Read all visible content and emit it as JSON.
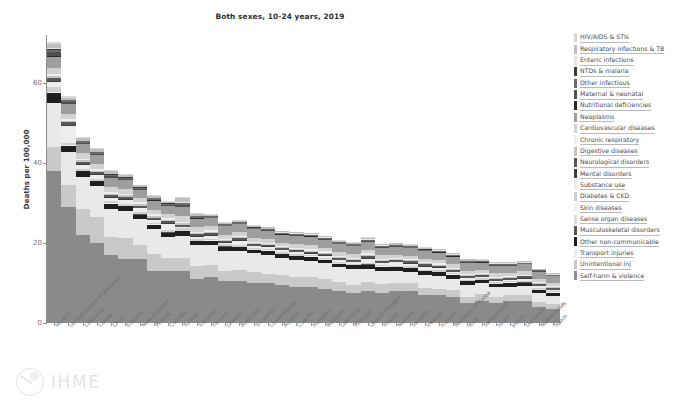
{
  "chart_data": {
    "type": "bar",
    "stacked": true,
    "title": "Both sexes, 10-24 years, 2019",
    "xlabel": "",
    "ylabel": "Deaths per 100,000",
    "ylim": [
      0,
      72
    ],
    "yticks": [
      0,
      20,
      40,
      60
    ],
    "grid": false,
    "legend_position": "right",
    "categories": [
      "Mexico",
      "United States of America",
      "Lithuania",
      "Latvia",
      "Chile",
      "Estonia",
      "New Zealand",
      "Poland",
      "Canada",
      "Turkey",
      "Slovakia",
      "Finland",
      "Greece",
      "Australia",
      "Slovenia",
      "Luxembourg",
      "Austria",
      "Czechia",
      "Hungary",
      "Belgium",
      "Germany",
      "Portugal",
      "United Kingdom",
      "France",
      "Norway",
      "Sweden",
      "Ireland",
      "Iceland",
      "Republic of Korea",
      "Italy",
      "Switzerland",
      "Israel",
      "Japan",
      "Denmark",
      "Netherlands",
      "Spain"
    ],
    "series": [
      {
        "name": "HIV/AIDS & STIs",
        "color": "#d9d9d9",
        "values": [
          0.6,
          0.4,
          0.2,
          0.3,
          0.3,
          0.3,
          0.2,
          0.2,
          0.2,
          0.2,
          0.2,
          0.2,
          0.2,
          0.2,
          0.1,
          0.1,
          0.1,
          0.1,
          0.1,
          0.1,
          0.1,
          0.1,
          0.1,
          0.1,
          0.1,
          0.1,
          0.1,
          0.1,
          0.1,
          0.1,
          0.1,
          0.1,
          0.1,
          0.1,
          0.1,
          0.1
        ]
      },
      {
        "name": "Respiratory infections & TB",
        "color": "#bfbfbf",
        "values": [
          0.9,
          0.5,
          0.6,
          0.6,
          0.6,
          0.5,
          0.4,
          0.4,
          0.3,
          0.9,
          0.4,
          0.3,
          0.3,
          0.3,
          0.3,
          0.3,
          0.3,
          0.3,
          0.3,
          0.3,
          0.3,
          0.3,
          0.4,
          0.3,
          0.3,
          0.3,
          0.3,
          0.3,
          0.3,
          0.3,
          0.2,
          0.3,
          0.3,
          0.2,
          0.2,
          0.2
        ]
      },
      {
        "name": "Enteric infections",
        "color": "#e6e6e6",
        "values": [
          0.3,
          0.1,
          0.1,
          0.1,
          0.2,
          0.1,
          0.1,
          0.1,
          0.1,
          0.2,
          0.1,
          0.1,
          0.1,
          0.1,
          0.1,
          0.1,
          0.1,
          0.1,
          0.1,
          0.1,
          0.1,
          0.1,
          0.1,
          0.1,
          0.1,
          0.1,
          0.1,
          0.1,
          0.1,
          0.1,
          0.1,
          0.1,
          0.1,
          0.1,
          0.1,
          0.1
        ]
      },
      {
        "name": "NTDs & malaria",
        "color": "#3a3a3a",
        "values": [
          0.2,
          0.1,
          0.05,
          0.05,
          0.1,
          0.05,
          0.05,
          0.05,
          0.05,
          0.1,
          0.05,
          0.05,
          0.05,
          0.05,
          0.05,
          0.05,
          0.05,
          0.05,
          0.05,
          0.05,
          0.05,
          0.05,
          0.05,
          0.05,
          0.05,
          0.05,
          0.05,
          0.05,
          0.05,
          0.05,
          0.05,
          0.05,
          0.05,
          0.05,
          0.05,
          0.05
        ]
      },
      {
        "name": "Other infectious",
        "color": "#6b6b6b",
        "values": [
          0.7,
          0.4,
          0.4,
          0.4,
          0.4,
          0.3,
          0.3,
          0.3,
          0.3,
          0.5,
          0.3,
          0.3,
          0.3,
          0.3,
          0.3,
          0.3,
          0.3,
          0.3,
          0.3,
          0.3,
          0.3,
          0.3,
          0.3,
          0.3,
          0.3,
          0.3,
          0.3,
          0.3,
          0.3,
          0.3,
          0.2,
          0.3,
          0.3,
          0.2,
          0.2,
          0.2
        ]
      },
      {
        "name": "Maternal & neonatal",
        "color": "#4f4f4f",
        "values": [
          1.0,
          0.4,
          0.2,
          0.2,
          0.4,
          0.2,
          0.2,
          0.2,
          0.2,
          0.5,
          0.2,
          0.1,
          0.1,
          0.1,
          0.1,
          0.1,
          0.1,
          0.1,
          0.1,
          0.1,
          0.1,
          0.1,
          0.1,
          0.1,
          0.1,
          0.1,
          0.1,
          0.1,
          0.1,
          0.1,
          0.1,
          0.1,
          0.1,
          0.1,
          0.1,
          0.1
        ]
      },
      {
        "name": "Nutritional deficiencies",
        "color": "#2b2b2b",
        "values": [
          0.2,
          0.1,
          0.05,
          0.05,
          0.1,
          0.05,
          0.05,
          0.05,
          0.05,
          0.1,
          0.05,
          0.05,
          0.05,
          0.05,
          0.05,
          0.05,
          0.05,
          0.05,
          0.05,
          0.05,
          0.05,
          0.05,
          0.05,
          0.05,
          0.05,
          0.05,
          0.05,
          0.05,
          0.05,
          0.05,
          0.05,
          0.05,
          0.05,
          0.05,
          0.05,
          0.05
        ]
      },
      {
        "name": "Neoplasms",
        "color": "#9e9e9e",
        "values": [
          2.6,
          2.4,
          2.4,
          2.3,
          2.3,
          2.3,
          2.2,
          2.3,
          2.2,
          2.2,
          2.2,
          2.1,
          2.1,
          2.0,
          2.1,
          2.0,
          2.0,
          2.1,
          2.1,
          2.0,
          2.0,
          2.0,
          2.0,
          1.9,
          1.9,
          1.9,
          1.9,
          1.9,
          1.9,
          1.9,
          1.8,
          1.9,
          1.8,
          1.8,
          1.8,
          1.8
        ]
      },
      {
        "name": "Cardiovascular diseases",
        "color": "#d2d2d2",
        "values": [
          1.6,
          1.3,
          1.4,
          1.3,
          1.2,
          1.2,
          1.0,
          1.2,
          1.0,
          1.4,
          1.1,
          1.0,
          1.0,
          0.9,
          1.0,
          0.9,
          0.9,
          1.0,
          1.1,
          0.9,
          0.9,
          0.9,
          0.9,
          0.9,
          0.8,
          0.8,
          0.8,
          0.8,
          0.9,
          0.8,
          0.8,
          0.8,
          0.8,
          0.8,
          0.8,
          0.7
        ]
      },
      {
        "name": "Chronic respiratory",
        "color": "#efefef",
        "values": [
          0.5,
          0.5,
          0.4,
          0.4,
          0.4,
          0.4,
          0.5,
          0.4,
          0.4,
          0.4,
          0.3,
          0.3,
          0.3,
          0.4,
          0.3,
          0.3,
          0.3,
          0.3,
          0.3,
          0.3,
          0.3,
          0.3,
          0.4,
          0.3,
          0.3,
          0.3,
          0.3,
          0.3,
          0.3,
          0.3,
          0.3,
          0.3,
          0.3,
          0.3,
          0.3,
          0.3
        ]
      },
      {
        "name": "Digestive diseases",
        "color": "#c4c4c4",
        "values": [
          0.6,
          0.4,
          0.4,
          0.4,
          0.4,
          0.4,
          0.3,
          0.4,
          0.3,
          0.4,
          0.3,
          0.3,
          0.3,
          0.3,
          0.3,
          0.3,
          0.3,
          0.3,
          0.3,
          0.3,
          0.3,
          0.3,
          0.3,
          0.3,
          0.3,
          0.3,
          0.3,
          0.3,
          0.3,
          0.3,
          0.2,
          0.3,
          0.3,
          0.2,
          0.2,
          0.2
        ]
      },
      {
        "name": "Neurological disorders",
        "color": "#585858",
        "values": [
          0.7,
          0.6,
          0.5,
          0.5,
          0.5,
          0.5,
          0.5,
          0.5,
          0.5,
          0.5,
          0.5,
          0.5,
          0.4,
          0.5,
          0.4,
          0.4,
          0.4,
          0.4,
          0.4,
          0.4,
          0.4,
          0.4,
          0.5,
          0.4,
          0.4,
          0.4,
          0.4,
          0.4,
          0.4,
          0.4,
          0.4,
          0.4,
          0.4,
          0.4,
          0.4,
          0.4
        ]
      },
      {
        "name": "Mental disorders",
        "color": "#3f3f3f",
        "values": [
          0.2,
          0.3,
          0.2,
          0.2,
          0.2,
          0.2,
          0.2,
          0.2,
          0.2,
          0.1,
          0.2,
          0.2,
          0.1,
          0.2,
          0.1,
          0.1,
          0.1,
          0.1,
          0.1,
          0.1,
          0.1,
          0.1,
          0.2,
          0.1,
          0.2,
          0.2,
          0.2,
          0.2,
          0.1,
          0.1,
          0.1,
          0.1,
          0.1,
          0.2,
          0.2,
          0.1
        ]
      },
      {
        "name": "Substance use",
        "color": "#ededed",
        "values": [
          1.2,
          4.2,
          1.0,
          0.9,
          0.7,
          1.0,
          0.9,
          0.6,
          1.6,
          0.3,
          0.6,
          0.9,
          0.4,
          1.0,
          0.5,
          0.6,
          0.5,
          0.5,
          0.4,
          0.6,
          0.5,
          0.4,
          1.0,
          0.5,
          0.8,
          0.7,
          0.7,
          0.6,
          0.2,
          0.4,
          0.4,
          0.3,
          0.2,
          0.5,
          0.4,
          0.3
        ]
      },
      {
        "name": "Diabetes & CKD",
        "color": "#cfcfcf",
        "values": [
          1.4,
          0.7,
          0.5,
          0.5,
          0.6,
          0.5,
          0.5,
          0.4,
          0.4,
          0.6,
          0.4,
          0.3,
          0.4,
          0.4,
          0.3,
          0.3,
          0.3,
          0.3,
          0.3,
          0.3,
          0.3,
          0.3,
          0.3,
          0.3,
          0.3,
          0.3,
          0.3,
          0.3,
          0.4,
          0.3,
          0.3,
          0.3,
          0.3,
          0.3,
          0.3,
          0.3
        ]
      },
      {
        "name": "Skin diseases",
        "color": "#f2f2f2",
        "values": [
          0.1,
          0.05,
          0.05,
          0.05,
          0.05,
          0.05,
          0.05,
          0.05,
          0.05,
          0.05,
          0.05,
          0.05,
          0.05,
          0.05,
          0.05,
          0.05,
          0.05,
          0.05,
          0.05,
          0.05,
          0.05,
          0.05,
          0.05,
          0.05,
          0.05,
          0.05,
          0.05,
          0.05,
          0.05,
          0.05,
          0.05,
          0.05,
          0.05,
          0.05,
          0.05,
          0.05
        ]
      },
      {
        "name": "Sense organ diseases",
        "color": "#dcdcdc",
        "values": [
          0.05,
          0.05,
          0.05,
          0.05,
          0.05,
          0.05,
          0.05,
          0.05,
          0.05,
          0.05,
          0.05,
          0.05,
          0.05,
          0.05,
          0.05,
          0.05,
          0.05,
          0.05,
          0.05,
          0.05,
          0.05,
          0.05,
          0.05,
          0.05,
          0.05,
          0.05,
          0.05,
          0.05,
          0.05,
          0.05,
          0.05,
          0.05,
          0.05,
          0.05,
          0.05,
          0.05
        ]
      },
      {
        "name": "Musculoskeletal disorders",
        "color": "#565656",
        "values": [
          0.1,
          0.1,
          0.05,
          0.05,
          0.1,
          0.05,
          0.05,
          0.05,
          0.05,
          0.05,
          0.05,
          0.05,
          0.05,
          0.05,
          0.05,
          0.05,
          0.05,
          0.05,
          0.05,
          0.05,
          0.05,
          0.05,
          0.05,
          0.05,
          0.05,
          0.05,
          0.05,
          0.05,
          0.05,
          0.05,
          0.05,
          0.05,
          0.05,
          0.05,
          0.05,
          0.05
        ]
      },
      {
        "name": "Other non-communicable",
        "color": "#1f1f1f",
        "values": [
          2.4,
          1.4,
          1.3,
          1.2,
          1.3,
          1.2,
          1.1,
          1.1,
          1.0,
          1.1,
          1.0,
          1.0,
          1.0,
          1.0,
          0.9,
          1.0,
          0.9,
          0.9,
          0.9,
          0.9,
          0.9,
          0.9,
          1.0,
          0.9,
          0.9,
          0.9,
          0.9,
          0.9,
          0.9,
          0.8,
          0.8,
          0.8,
          0.9,
          0.8,
          0.8,
          0.8
        ]
      },
      {
        "name": "Transport injuries",
        "color": "#e9e9e9",
        "values": [
          11.0,
          8.4,
          8.0,
          7.8,
          7.0,
          6.8,
          6.6,
          6.2,
          5.4,
          5.6,
          5.2,
          5.0,
          5.2,
          4.6,
          4.6,
          4.8,
          4.2,
          4.2,
          4.0,
          4.0,
          3.7,
          4.0,
          3.4,
          3.4,
          3.0,
          2.8,
          3.2,
          3.2,
          2.8,
          3.0,
          2.6,
          2.6,
          2.0,
          2.4,
          2.2,
          2.0
        ]
      },
      {
        "name": "Unintentional inj",
        "color": "#c9c9c9",
        "values": [
          6.0,
          5.4,
          6.6,
          6.4,
          4.4,
          5.2,
          3.4,
          4.2,
          3.2,
          3.2,
          3.2,
          3.0,
          2.4,
          2.8,
          2.8,
          2.2,
          2.6,
          2.6,
          2.6,
          2.4,
          2.2,
          2.0,
          2.2,
          2.2,
          2.0,
          2.0,
          1.8,
          1.6,
          1.8,
          1.6,
          1.8,
          1.4,
          1.6,
          1.4,
          1.3,
          1.2
        ]
      },
      {
        "name": "Self-harm & violence",
        "color": "#8a8a8a",
        "values": [
          38.0,
          29.0,
          22.0,
          20.0,
          17.0,
          16.0,
          16.0,
          13.0,
          13.0,
          13.0,
          11.0,
          11.5,
          10.5,
          10.5,
          10.0,
          10.0,
          9.5,
          9.0,
          9.0,
          8.5,
          8.0,
          7.5,
          8.0,
          7.5,
          8.0,
          8.0,
          7.0,
          7.0,
          6.5,
          5.0,
          5.5,
          5.0,
          5.5,
          5.5,
          4.0,
          3.5
        ]
      }
    ]
  },
  "branding": {
    "logo_text": "IHME",
    "footnote": ""
  }
}
